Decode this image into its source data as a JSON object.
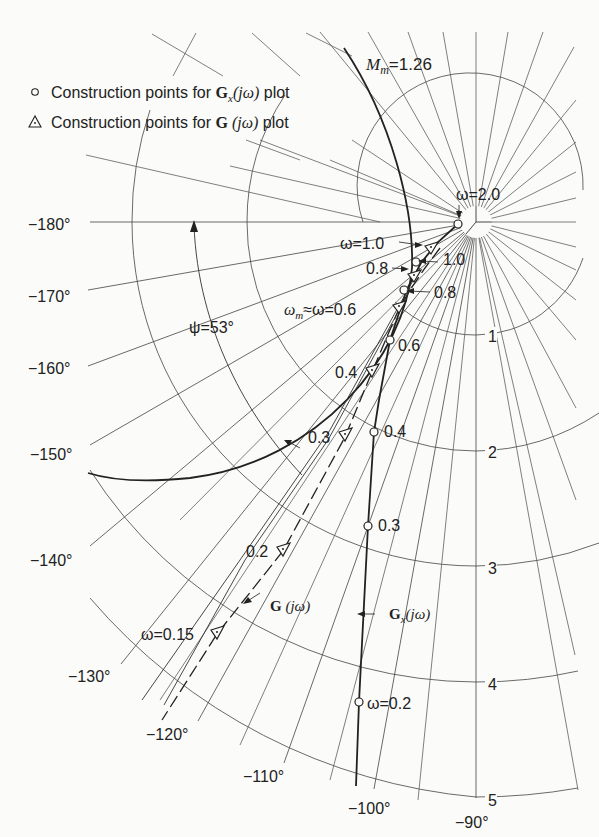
{
  "legend": {
    "circle_item": {
      "prefix": "Construction points for ",
      "symbol": "G",
      "subscript": "x",
      "arg": "(jω)",
      "suffix": " plot"
    },
    "triangle_item": {
      "prefix": "Construction points for ",
      "symbol": "G",
      "arg": " (jω)",
      "suffix": " plot"
    }
  },
  "annotations": {
    "mm": {
      "M": "M",
      "sub": "m",
      "value": "=1.26"
    },
    "psi": "ψ=53°",
    "omega_m": {
      "prefix": "ω",
      "sub": "m",
      "rest": "≈ω=0.6"
    },
    "omega_2": "ω=2.0",
    "omega_1": "ω=1.0",
    "gx_curve_label": {
      "symbol": "G",
      "sub": "x",
      "arg": "(jω)"
    },
    "g_curve_label": {
      "symbol": "G",
      "arg": " (jω)"
    }
  },
  "phase_labels": [
    {
      "text": "−180°",
      "x": 28,
      "y": 230
    },
    {
      "text": "−170°",
      "x": 28,
      "y": 302
    },
    {
      "text": "−160°",
      "x": 28,
      "y": 374
    },
    {
      "text": "−150°",
      "x": 30,
      "y": 460
    },
    {
      "text": "−140°",
      "x": 30,
      "y": 566
    },
    {
      "text": "−130°",
      "x": 68,
      "y": 682
    },
    {
      "text": "−120°",
      "x": 146,
      "y": 740
    },
    {
      "text": "−110°",
      "x": 243,
      "y": 782
    },
    {
      "text": "−100°",
      "x": 348,
      "y": 814
    },
    {
      "text": "−90°",
      "x": 455,
      "y": 828
    }
  ],
  "magnitude_labels": [
    {
      "text": "1",
      "x": 488,
      "y": 342
    },
    {
      "text": "2",
      "x": 488,
      "y": 458
    },
    {
      "text": "3",
      "x": 488,
      "y": 574
    },
    {
      "text": "4",
      "x": 488,
      "y": 690
    },
    {
      "text": "5",
      "x": 488,
      "y": 806
    }
  ],
  "gx_points": [
    {
      "label": "0.3",
      "x": 368,
      "y": 526,
      "lx": 378,
      "ly": 531
    },
    {
      "label": "0.4",
      "x": 374,
      "y": 432,
      "lx": 384,
      "ly": 437
    },
    {
      "label": "0.6",
      "x": 390,
      "y": 340,
      "lx": 398,
      "ly": 351
    },
    {
      "label": "ω=0.2",
      "x": 359,
      "y": 702,
      "lx": 367,
      "ly": 709
    }
  ],
  "g_points": [
    {
      "label": "0.2",
      "x": 283,
      "y": 551,
      "lx": 246,
      "ly": 557
    },
    {
      "label": "0.3",
      "x": 345,
      "y": 437,
      "lx": 308,
      "ly": 443
    },
    {
      "label": "0.4",
      "x": 372,
      "y": 372,
      "lx": 335,
      "ly": 378
    },
    {
      "label": "ω=0.15",
      "x": 217,
      "y": 634,
      "lx": 141,
      "ly": 640
    }
  ],
  "near_center_labels": [
    {
      "text": "0.8",
      "x": 366,
      "y": 274
    },
    {
      "text": "1.0",
      "x": 443,
      "y": 265
    },
    {
      "text": "0.8",
      "x": 434,
      "y": 298
    }
  ]
}
